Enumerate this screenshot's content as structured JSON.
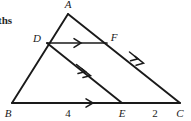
{
  "figure": {
    "type": "geometry-diagram",
    "background_color": "#ffffff",
    "stroke_color": "#1a1a1a",
    "margin_text": "ths",
    "vertices": [
      {
        "id": "A",
        "label": "A",
        "x": 68,
        "y": 14,
        "label_x": 68,
        "label_y": 8
      },
      {
        "id": "B",
        "label": "B",
        "x": 12,
        "y": 103,
        "label_x": 8,
        "label_y": 117
      },
      {
        "id": "C",
        "label": "C",
        "x": 180,
        "y": 103,
        "label_x": 180,
        "label_y": 117
      },
      {
        "id": "D",
        "label": "D",
        "x": 47,
        "y": 43,
        "label_x": 37,
        "label_y": 42
      },
      {
        "id": "E",
        "label": "E",
        "x": 122,
        "y": 103,
        "label_x": 122,
        "label_y": 117
      },
      {
        "id": "F",
        "label": "F",
        "x": 107,
        "y": 43,
        "label_x": 114,
        "label_y": 41
      }
    ],
    "segments": [
      {
        "name": "side-AB",
        "from": "A",
        "to": "B",
        "marks": 0
      },
      {
        "name": "side-AC",
        "from": "A",
        "to": "C",
        "marks": 0
      },
      {
        "name": "side-BC",
        "from": "B",
        "to": "C",
        "marks": 1
      },
      {
        "name": "segment-DF",
        "from": "D",
        "to": "F",
        "marks": 1
      },
      {
        "name": "segment-DE",
        "from": "D",
        "to": "E",
        "marks": 2
      },
      {
        "name": "segment-FC",
        "from": "F",
        "to": "C",
        "marks": 2
      }
    ],
    "measures": [
      {
        "name": "measure-BE",
        "label": "4",
        "x": 68,
        "y": 117
      },
      {
        "name": "measure-EC",
        "label": "2",
        "x": 155,
        "y": 117
      }
    ]
  }
}
